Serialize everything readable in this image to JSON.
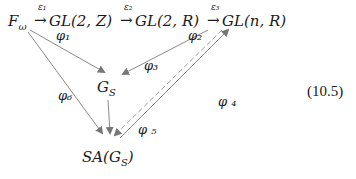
{
  "diagram": {
    "top_row": {
      "F": "F",
      "F_sub": "ω",
      "arrow1_label": "ε₁",
      "GL2Z": "GL(2, Z)",
      "arrow2_label": "ε₂",
      "GL2R": "GL(2, R)",
      "arrow3_label": "ε₃",
      "GLnR": "GL(n, R)"
    },
    "nodes": {
      "Gs": "G",
      "Gs_sub": "S",
      "SA": "SA(G",
      "SA_sub": "S",
      "SA_close": ")"
    },
    "maps": {
      "phi1": "φ₁",
      "phi2": "φ₂",
      "phi3": "φ₃",
      "phi4": "φ ₄",
      "phi5": "φ ₅",
      "phi6": "φ₆"
    },
    "equation_number": "(10.5)"
  }
}
